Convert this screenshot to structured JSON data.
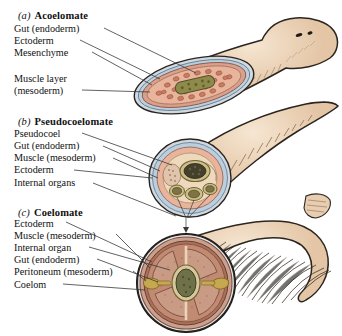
{
  "figure": {
    "background_color": "#ffffff",
    "width": 342,
    "height": 336
  },
  "palette": {
    "body_tan": "#e8cdb0",
    "body_tan_light": "#f2ddc6",
    "outline": "#2b2520",
    "ectoderm_blue": "#b9cfe0",
    "mesenchyme_pink": "#e8b49c",
    "muscle_rose": "#d9a08c",
    "gut_olive": "#8d8a4a",
    "gut_dark": "#4a4430",
    "organ_gold": "#c6a94e",
    "peritoneum_brown": "#a9715a",
    "coelom_cream": "#efd9bd",
    "leader_line": "#3a3a3a"
  },
  "panels": [
    {
      "id": "a",
      "letter": "(a)",
      "title": "Acoelomate",
      "animal": "flatworm",
      "labels": [
        {
          "id": "gut-endoderm",
          "text": "Gut (endoderm)"
        },
        {
          "id": "ectoderm",
          "text": "Ectoderm"
        },
        {
          "id": "mesenchyme",
          "text": "Mesenchyme"
        },
        {
          "id": "muscle-layer",
          "text": "Muscle layer"
        },
        {
          "id": "mesoderm-paren",
          "text": "(mesoderm)"
        }
      ]
    },
    {
      "id": "b",
      "letter": "(b)",
      "title": "Pseudocoelomate",
      "animal": "roundworm",
      "labels": [
        {
          "id": "pseudocoel",
          "text": "Pseudocoel"
        },
        {
          "id": "gut-endoderm",
          "text": "Gut (endoderm)"
        },
        {
          "id": "muscle-mesoderm",
          "text": "Muscle (mesoderm)"
        },
        {
          "id": "ectoderm",
          "text": "Ectoderm"
        },
        {
          "id": "internal-organs",
          "text": "Internal organs"
        }
      ]
    },
    {
      "id": "c",
      "letter": "(c)",
      "title": "Coelomate",
      "animal": "earthworm",
      "labels": [
        {
          "id": "ectoderm",
          "text": "Ectoderm"
        },
        {
          "id": "muscle-mesoderm",
          "text": "Muscle (mesoderm)"
        },
        {
          "id": "internal-organ",
          "text": "Internal organ"
        },
        {
          "id": "gut-endoderm",
          "text": "Gut (endoderm)"
        },
        {
          "id": "peritoneum-mesoderm",
          "text": "Peritoneum (mesoderm)"
        },
        {
          "id": "coelom",
          "text": "Coelom"
        }
      ]
    }
  ]
}
